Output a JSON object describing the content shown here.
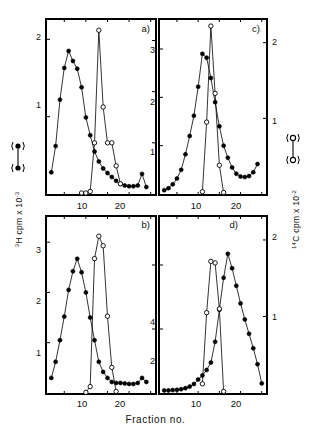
{
  "figure": {
    "xlabel": "Fraction no.",
    "ylabel_left": "H cpm x 10",
    "ylabel_left_sup1": "3",
    "ylabel_left_sup2": "-3",
    "ylabel_right": "C cpm x 10",
    "ylabel_right_sup1": "14",
    "ylabel_right_sup2": "-2",
    "caption_fragment": "",
    "series_legend": {
      "filled_label": "3H (filled circles)",
      "open_label": "14C (open circles)"
    },
    "panels": [
      {
        "letter": "a)",
        "y_left_ticks": [
          "1",
          "2"
        ],
        "y_right_ticks": [
          "1",
          "2",
          "3"
        ],
        "x_ticks": [
          "10",
          "20"
        ]
      },
      {
        "letter": "c)",
        "y_left_ticks": [
          "1",
          "2",
          "3"
        ],
        "y_right_ticks": [
          "1",
          "2"
        ],
        "x_ticks": [
          "10",
          "20"
        ]
      },
      {
        "letter": "b)",
        "y_left_ticks": [
          "1",
          "2",
          "3"
        ],
        "y_right_ticks": [
          "2",
          "4"
        ],
        "x_ticks": [
          "10",
          "20"
        ]
      },
      {
        "letter": "d)",
        "y_left_ticks": [
          "2",
          "4"
        ],
        "y_right_ticks": [
          "1",
          "2"
        ],
        "x_ticks": [
          "10",
          "20"
        ]
      }
    ]
  },
  "chart_data": [
    {
      "type": "line",
      "panel": "a)",
      "title": "",
      "xlabel": "Fraction no.",
      "ylabel": "3H cpm x 10^-3",
      "ylabel_right": "14C cpm x 10^-2",
      "xlim": [
        1,
        26
      ],
      "ylim_left": [
        0,
        2.25
      ],
      "ylim_right": [
        0,
        3.4
      ],
      "xticks": [
        10,
        20
      ],
      "yticks_left": [
        1,
        2
      ],
      "yticks_right": [
        1,
        2,
        3
      ],
      "grid": false,
      "series": [
        {
          "name": "3H",
          "marker": "filled-circle",
          "axis": "left",
          "x": [
            2,
            3,
            4,
            5,
            6,
            7,
            8,
            9,
            10,
            11,
            12,
            13,
            14,
            15,
            16,
            17,
            18,
            19,
            20,
            21,
            22,
            23,
            24
          ],
          "values": [
            0.28,
            0.62,
            1.22,
            1.63,
            1.85,
            1.72,
            1.62,
            1.38,
            0.99,
            0.76,
            0.55,
            0.42,
            0.33,
            0.27,
            0.22,
            0.17,
            0.13,
            0.11,
            0.1,
            0.1,
            0.11,
            0.26,
            0.09
          ]
        },
        {
          "name": "14C",
          "marker": "open-circle",
          "axis": "right",
          "x": [
            9,
            10,
            11,
            12,
            13,
            14,
            15,
            16,
            17,
            18
          ],
          "values": [
            0.02,
            0.02,
            0.05,
            1.0,
            3.2,
            1.7,
            1.0,
            1.0,
            0.55,
            0.2
          ]
        }
      ]
    },
    {
      "type": "line",
      "panel": "c)",
      "title": "",
      "xlabel": "Fraction no.",
      "ylabel": "3H cpm x 10^-3",
      "ylabel_right": "14C cpm x 10^-2",
      "xlim": [
        1,
        26
      ],
      "ylim_left": [
        0,
        3.6
      ],
      "ylim_right": [
        0,
        2.3
      ],
      "xticks": [
        10,
        20
      ],
      "yticks_left": [
        1,
        2,
        3
      ],
      "yticks_right": [
        1,
        2
      ],
      "grid": false,
      "series": [
        {
          "name": "3H",
          "marker": "filled-circle",
          "axis": "left",
          "x": [
            2,
            3,
            4,
            5,
            6,
            7,
            8,
            9,
            10,
            11,
            12,
            13,
            14,
            15,
            16,
            17,
            18,
            19,
            20,
            21,
            22,
            23,
            24
          ],
          "values": [
            0.08,
            0.12,
            0.2,
            0.32,
            0.5,
            0.82,
            1.2,
            1.62,
            2.22,
            2.9,
            2.82,
            2.4,
            1.9,
            1.4,
            1.0,
            0.75,
            0.55,
            0.42,
            0.36,
            0.35,
            0.37,
            0.45,
            0.62
          ]
        },
        {
          "name": "14C",
          "marker": "open-circle",
          "axis": "right",
          "x": [
            11,
            12,
            13,
            14,
            15,
            16
          ],
          "values": [
            0.03,
            0.95,
            2.22,
            1.33,
            0.38,
            0.02
          ]
        }
      ]
    },
    {
      "type": "line",
      "panel": "b)",
      "title": "",
      "xlabel": "Fraction no.",
      "ylabel": "3H cpm x 10^-3",
      "ylabel_right": "14C cpm x 10^-2",
      "xlim": [
        1,
        26
      ],
      "ylim_left": [
        0,
        3.5
      ],
      "ylim_right": [
        0,
        5.5
      ],
      "xticks": [
        10,
        20
      ],
      "yticks_left": [
        1,
        2,
        3
      ],
      "yticks_right": [
        2,
        4
      ],
      "grid": false,
      "series": [
        {
          "name": "3H",
          "marker": "filled-circle",
          "axis": "left",
          "x": [
            2,
            3,
            4,
            5,
            6,
            7,
            8,
            9,
            10,
            11,
            12,
            13,
            14,
            15,
            16,
            17,
            18,
            19,
            20,
            21,
            22,
            23,
            24
          ],
          "values": [
            0.3,
            0.62,
            1.05,
            1.52,
            2.05,
            2.42,
            2.67,
            2.4,
            2.0,
            1.5,
            1.05,
            0.62,
            0.42,
            0.3,
            0.22,
            0.2,
            0.2,
            0.19,
            0.18,
            0.18,
            0.2,
            0.3,
            0.22
          ]
        },
        {
          "name": "14C",
          "marker": "open-circle",
          "axis": "right",
          "x": [
            10,
            11,
            12,
            13,
            14,
            15,
            16,
            17
          ],
          "values": [
            0.02,
            0.2,
            4.2,
            4.9,
            4.6,
            2.4,
            0.8,
            0.05
          ]
        }
      ]
    },
    {
      "type": "line",
      "panel": "d)",
      "title": "",
      "xlabel": "Fraction no.",
      "ylabel": "3H cpm x 10^-3",
      "ylabel_right": "14C cpm x 10^-2",
      "xlim": [
        1,
        26
      ],
      "ylim_left": [
        0,
        5.5
      ],
      "ylim_right": [
        0,
        2.3
      ],
      "xticks": [
        10,
        20
      ],
      "yticks_left": [
        2,
        4
      ],
      "yticks_right": [
        1,
        2
      ],
      "grid": false,
      "series": [
        {
          "name": "3H",
          "marker": "filled-circle",
          "axis": "left",
          "x": [
            2,
            3,
            4,
            5,
            6,
            7,
            8,
            9,
            10,
            11,
            12,
            13,
            14,
            15,
            16,
            17,
            18,
            19,
            20,
            21,
            22,
            23,
            24,
            25
          ],
          "values": [
            0.08,
            0.08,
            0.09,
            0.1,
            0.12,
            0.15,
            0.2,
            0.28,
            0.42,
            0.55,
            0.72,
            0.95,
            1.6,
            2.6,
            3.6,
            4.35,
            3.9,
            3.35,
            2.8,
            2.3,
            1.85,
            1.4,
            0.9,
            0.3
          ]
        },
        {
          "name": "14C",
          "marker": "open-circle",
          "axis": "right",
          "x": [
            11,
            12,
            13,
            14,
            15,
            16
          ],
          "values": [
            0.12,
            1.05,
            1.72,
            1.7,
            1.1,
            0.02
          ]
        }
      ]
    }
  ]
}
